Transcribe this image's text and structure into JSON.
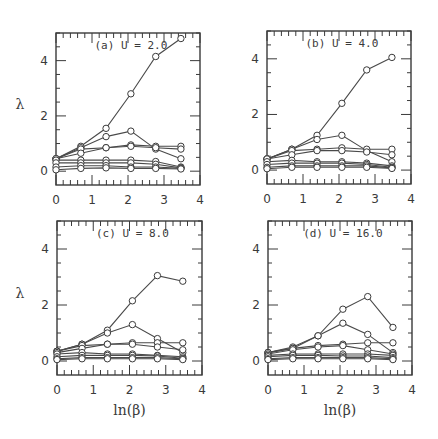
{
  "figure": {
    "ylabel": "λ",
    "xlabel": "ln(β)"
  },
  "chart_data": [
    {
      "type": "line",
      "title": "(a) U = 2.0",
      "xlabel": "ln(β)",
      "ylabel": "λ",
      "xlim": [
        0,
        4
      ],
      "ylim": [
        -0.5,
        5
      ],
      "xticks": [
        0,
        1,
        2,
        3,
        4
      ],
      "yticks": [
        0,
        2,
        4
      ],
      "grid": false,
      "x": [
        0.0,
        0.69,
        1.39,
        2.08,
        2.77,
        3.47
      ],
      "series": [
        {
          "name": "1",
          "values": [
            0.45,
            0.9,
            1.55,
            2.8,
            4.15,
            4.8
          ]
        },
        {
          "name": "2",
          "values": [
            0.45,
            0.85,
            1.25,
            1.45,
            0.8,
            0.45
          ]
        },
        {
          "name": "3",
          "values": [
            0.45,
            0.8,
            0.85,
            0.95,
            0.9,
            0.9
          ]
        },
        {
          "name": "4",
          "values": [
            0.45,
            0.65,
            0.85,
            0.9,
            0.85,
            0.8
          ]
        },
        {
          "name": "5",
          "values": [
            0.4,
            0.4,
            0.4,
            0.4,
            0.35,
            0.15
          ]
        },
        {
          "name": "6",
          "values": [
            0.3,
            0.3,
            0.3,
            0.3,
            0.25,
            0.12
          ]
        },
        {
          "name": "7",
          "values": [
            0.15,
            0.2,
            0.2,
            0.15,
            0.15,
            0.1
          ]
        },
        {
          "name": "8",
          "values": [
            0.05,
            0.1,
            0.12,
            0.1,
            0.1,
            0.08
          ]
        }
      ]
    },
    {
      "type": "line",
      "title": "(b) U = 4.0",
      "xlabel": "ln(β)",
      "ylabel": "λ",
      "xlim": [
        0,
        4
      ],
      "ylim": [
        -0.5,
        5
      ],
      "xticks": [
        0,
        1,
        2,
        3,
        4
      ],
      "yticks": [
        0,
        2,
        4
      ],
      "grid": false,
      "x": [
        0.0,
        0.69,
        1.39,
        2.08,
        2.77,
        3.47
      ],
      "series": [
        {
          "name": "1",
          "values": [
            0.4,
            0.75,
            1.25,
            2.4,
            3.6,
            4.05
          ]
        },
        {
          "name": "2",
          "values": [
            0.4,
            0.75,
            1.1,
            1.25,
            0.7,
            0.3
          ]
        },
        {
          "name": "3",
          "values": [
            0.4,
            0.7,
            0.75,
            0.8,
            0.75,
            0.75
          ]
        },
        {
          "name": "4",
          "values": [
            0.4,
            0.55,
            0.7,
            0.7,
            0.65,
            0.55
          ]
        },
        {
          "name": "5",
          "values": [
            0.3,
            0.35,
            0.3,
            0.3,
            0.25,
            0.15
          ]
        },
        {
          "name": "6",
          "values": [
            0.2,
            0.25,
            0.25,
            0.25,
            0.2,
            0.1
          ]
        },
        {
          "name": "7",
          "values": [
            0.1,
            0.15,
            0.15,
            0.15,
            0.15,
            0.08
          ]
        },
        {
          "name": "8",
          "values": [
            0.05,
            0.1,
            0.1,
            0.1,
            0.1,
            0.06
          ]
        }
      ]
    },
    {
      "type": "line",
      "title": "(c) U = 8.0",
      "xlabel": "ln(β)",
      "ylabel": "λ",
      "xlim": [
        0,
        4
      ],
      "ylim": [
        -0.5,
        5
      ],
      "xticks": [
        0,
        1,
        2,
        3,
        4
      ],
      "yticks": [
        0,
        2,
        4
      ],
      "grid": false,
      "x": [
        0.0,
        0.69,
        1.39,
        2.08,
        2.77,
        3.47
      ],
      "series": [
        {
          "name": "1",
          "values": [
            0.35,
            0.6,
            1.1,
            2.15,
            3.05,
            2.85
          ]
        },
        {
          "name": "2",
          "values": [
            0.35,
            0.6,
            1.0,
            1.3,
            0.8,
            0.3
          ]
        },
        {
          "name": "3",
          "values": [
            0.35,
            0.55,
            0.6,
            0.65,
            0.65,
            0.65
          ]
        },
        {
          "name": "4",
          "values": [
            0.3,
            0.45,
            0.6,
            0.6,
            0.5,
            0.4
          ]
        },
        {
          "name": "5",
          "values": [
            0.25,
            0.3,
            0.25,
            0.25,
            0.2,
            0.15
          ]
        },
        {
          "name": "6",
          "values": [
            0.15,
            0.2,
            0.2,
            0.2,
            0.18,
            0.1
          ]
        },
        {
          "name": "7",
          "values": [
            0.08,
            0.12,
            0.12,
            0.12,
            0.12,
            0.08
          ]
        },
        {
          "name": "8",
          "values": [
            0.05,
            0.08,
            0.08,
            0.08,
            0.08,
            0.05
          ]
        }
      ]
    },
    {
      "type": "line",
      "title": "(d) U = 16.0",
      "xlabel": "ln(β)",
      "ylabel": "λ",
      "xlim": [
        0,
        4
      ],
      "ylim": [
        -0.5,
        5
      ],
      "xticks": [
        0,
        1,
        2,
        3,
        4
      ],
      "yticks": [
        0,
        2,
        4
      ],
      "grid": false,
      "x": [
        0.0,
        0.69,
        1.39,
        2.08,
        2.77,
        3.47
      ],
      "series": [
        {
          "name": "1",
          "values": [
            0.3,
            0.5,
            0.9,
            1.85,
            2.3,
            1.2
          ]
        },
        {
          "name": "2",
          "values": [
            0.3,
            0.45,
            0.9,
            1.35,
            0.95,
            0.3
          ]
        },
        {
          "name": "3",
          "values": [
            0.3,
            0.45,
            0.55,
            0.6,
            0.65,
            0.65
          ]
        },
        {
          "name": "4",
          "values": [
            0.25,
            0.4,
            0.5,
            0.55,
            0.4,
            0.25
          ]
        },
        {
          "name": "5",
          "values": [
            0.2,
            0.25,
            0.25,
            0.25,
            0.25,
            0.2
          ]
        },
        {
          "name": "6",
          "values": [
            0.15,
            0.2,
            0.2,
            0.18,
            0.18,
            0.12
          ]
        },
        {
          "name": "7",
          "values": [
            0.08,
            0.12,
            0.12,
            0.12,
            0.12,
            0.08
          ]
        },
        {
          "name": "8",
          "values": [
            0.05,
            0.08,
            0.08,
            0.08,
            0.08,
            0.05
          ]
        }
      ]
    }
  ],
  "layout": {
    "panels": [
      {
        "left": 56,
        "top": 33,
        "right": 200,
        "bottom": 185,
        "showYLabel": true,
        "showXLabel": false
      },
      {
        "left": 267,
        "top": 31,
        "right": 411,
        "bottom": 184,
        "showYLabel": false,
        "showXLabel": false
      },
      {
        "left": 57,
        "top": 221,
        "right": 202,
        "bottom": 375,
        "showYLabel": true,
        "showXLabel": true
      },
      {
        "left": 268,
        "top": 221,
        "right": 412,
        "bottom": 375,
        "showYLabel": false,
        "showXLabel": true
      }
    ]
  }
}
